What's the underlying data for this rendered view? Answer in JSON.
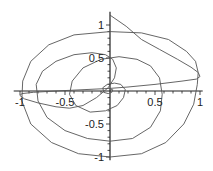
{
  "chart_data": {
    "type": "line",
    "title": "",
    "xlabel": "",
    "ylabel": "",
    "xlim": [
      -1.07,
      1.03
    ],
    "ylim": [
      -1.05,
      1.2
    ],
    "grid": false,
    "axes_style": "cross-at-origin",
    "x_ticks": [
      {
        "value": -1,
        "label": "-1"
      },
      {
        "value": -0.5,
        "label": "-0.5"
      },
      {
        "value": 0.5,
        "label": "0.5"
      },
      {
        "value": 1,
        "label": "1"
      }
    ],
    "y_ticks": [
      {
        "value": 1,
        "label": "1"
      },
      {
        "value": 0.5,
        "label": "0.5"
      },
      {
        "value": -0.5,
        "label": "-0.5"
      },
      {
        "value": -1,
        "label": "-1"
      }
    ],
    "series": [
      {
        "name": "curve",
        "color": "#555555",
        "points": [
          [
            0.0,
            1.15
          ],
          [
            0.18,
            0.98
          ],
          [
            0.35,
            0.78
          ],
          [
            0.55,
            0.63
          ],
          [
            0.75,
            0.48
          ],
          [
            0.9,
            0.36
          ],
          [
            0.98,
            0.28
          ],
          [
            1.0,
            0.22
          ],
          [
            0.96,
            0.18
          ],
          [
            0.8,
            0.15
          ],
          [
            0.5,
            0.1
          ],
          [
            0.2,
            0.06
          ],
          [
            0.0,
            0.04
          ],
          [
            -0.3,
            0.02
          ],
          [
            -0.6,
            0.0
          ],
          [
            -0.85,
            -0.02
          ],
          [
            -0.98,
            -0.04
          ],
          [
            -1.0,
            -0.07
          ],
          [
            -0.95,
            -0.12
          ],
          [
            -0.8,
            -0.18
          ],
          [
            -0.6,
            -0.24
          ],
          [
            -0.45,
            -0.26
          ],
          [
            -0.3,
            -0.22
          ],
          [
            -0.15,
            -0.1
          ],
          [
            -0.02,
            0.05
          ],
          [
            0.05,
            0.2
          ],
          [
            0.07,
            0.35
          ],
          [
            0.03,
            0.48
          ],
          [
            -0.05,
            0.55
          ],
          [
            -0.2,
            0.58
          ],
          [
            -0.4,
            0.55
          ],
          [
            -0.6,
            0.45
          ],
          [
            -0.75,
            0.3
          ],
          [
            -0.82,
            0.1
          ],
          [
            -0.8,
            -0.15
          ],
          [
            -0.7,
            -0.4
          ],
          [
            -0.5,
            -0.6
          ],
          [
            -0.25,
            -0.72
          ],
          [
            0.0,
            -0.76
          ],
          [
            0.25,
            -0.72
          ],
          [
            0.45,
            -0.55
          ],
          [
            0.56,
            -0.3
          ],
          [
            0.58,
            -0.05
          ],
          [
            0.55,
            0.2
          ],
          [
            0.45,
            0.38
          ],
          [
            0.3,
            0.48
          ],
          [
            0.1,
            0.52
          ],
          [
            -0.1,
            0.48
          ],
          [
            -0.3,
            0.35
          ],
          [
            -0.42,
            0.15
          ],
          [
            -0.45,
            -0.05
          ],
          [
            -0.38,
            -0.22
          ],
          [
            -0.22,
            -0.32
          ],
          [
            -0.05,
            -0.3
          ],
          [
            0.08,
            -0.22
          ],
          [
            0.15,
            -0.1
          ],
          [
            0.17,
            0.02
          ],
          [
            0.12,
            0.1
          ],
          [
            0.05,
            0.12
          ],
          [
            -0.03,
            0.1
          ],
          [
            -0.08,
            0.05
          ],
          [
            -0.07,
            -0.02
          ],
          [
            -0.02,
            -0.04
          ],
          [
            0.02,
            -0.02
          ],
          [
            0.03,
            0.02
          ],
          [
            0.0,
            0.03
          ]
        ]
      },
      {
        "name": "outer-loop",
        "color": "#555555",
        "points": [
          [
            0.98,
            0.28
          ],
          [
            0.97,
            0.1
          ],
          [
            0.93,
            -0.2
          ],
          [
            0.82,
            -0.5
          ],
          [
            0.62,
            -0.78
          ],
          [
            0.35,
            -0.95
          ],
          [
            0.0,
            -1.0
          ],
          [
            -0.35,
            -0.95
          ],
          [
            -0.65,
            -0.78
          ],
          [
            -0.88,
            -0.5
          ],
          [
            -0.98,
            -0.15
          ],
          [
            -0.97,
            0.15
          ],
          [
            -0.88,
            0.45
          ],
          [
            -0.68,
            0.7
          ],
          [
            -0.4,
            0.85
          ],
          [
            0.0,
            0.9
          ],
          [
            0.35,
            0.88
          ],
          [
            0.65,
            0.78
          ],
          [
            0.85,
            0.6
          ],
          [
            0.95,
            0.45
          ],
          [
            0.98,
            0.28
          ]
        ]
      }
    ]
  }
}
